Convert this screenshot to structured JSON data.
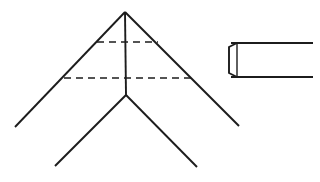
{
  "figure": {
    "background_color": "#ffffff",
    "stroke_color": "#1c1c1c",
    "canvas": {
      "width": 320,
      "height": 182
    },
    "style": {
      "solid_stroke_width": 1.9,
      "dashed_stroke_width": 1.6,
      "dash_pattern": "7,5"
    },
    "chevron": {
      "name": "chevron-outline",
      "apex": {
        "x": 125,
        "y": 12
      },
      "inner_junction": {
        "x": 126,
        "y": 95
      },
      "left_outer_end": {
        "x": 15,
        "y": 127
      },
      "right_outer_end": {
        "x": 239,
        "y": 126
      },
      "lower_left_leg_end": {
        "x": 55,
        "y": 166
      },
      "lower_right_leg_end": {
        "x": 197,
        "y": 167
      },
      "center_axis": {
        "x1": 125,
        "y1": 12,
        "x2": 126,
        "y2": 95
      }
    },
    "dashed_lines": [
      {
        "name": "upper-section-line",
        "x1": 97,
        "y1": 42,
        "x2": 158,
        "y2": 42
      },
      {
        "name": "lower-section-line",
        "x1": 64,
        "y1": 78,
        "x2": 191,
        "y2": 78
      }
    ],
    "bar": {
      "name": "bar-end-view",
      "top_y": 43,
      "bottom_y": 77,
      "right_x": 313,
      "chamfer_left_x": 229,
      "body_left_x": 237,
      "chamfer_top_y": 47,
      "chamfer_bottom_y": 73
    }
  }
}
